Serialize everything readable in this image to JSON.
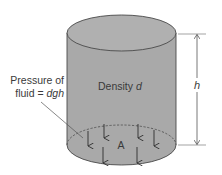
{
  "diagram": {
    "colors": {
      "fluid_fill": "#a9a9a9",
      "fluid_top_fill": "#b3b3b3",
      "outline": "#4a4a4a",
      "arrow": "#2e2e2e",
      "dimension_line": "#555555",
      "text": "#3a3a3a"
    },
    "labels": {
      "density_prefix": "Density ",
      "density_symbol": "d",
      "pressure_line1": "Pressure of",
      "pressure_line2_prefix": "fluid = ",
      "pressure_formula": "dgh",
      "area": "A",
      "height": "h"
    },
    "arrows": {
      "count": 6,
      "direction": "down",
      "meaning": "pressure acting on base area"
    }
  }
}
